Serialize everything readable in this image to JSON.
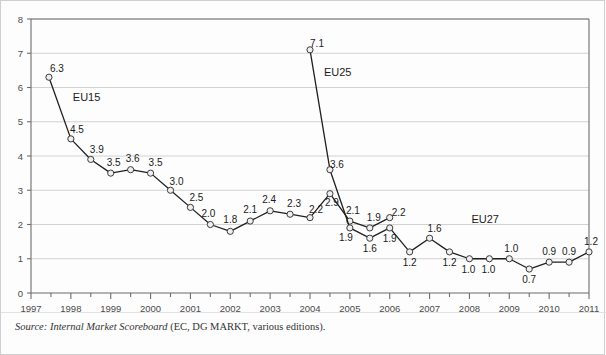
{
  "figure": {
    "background_color": "#fdfdfd",
    "border_color": "#cfcfcf"
  },
  "source": {
    "prefix": "Source:",
    "title": "Internal Market Scoreboard",
    "rest": "(EC, DG MARKT, various editions)."
  },
  "chart_data": {
    "type": "line",
    "title": "",
    "xlabel": "",
    "ylabel": "",
    "xlim": [
      1997,
      2011
    ],
    "ylim": [
      0,
      8
    ],
    "yticks": [
      0,
      1,
      2,
      3,
      4,
      5,
      6,
      7,
      8
    ],
    "xticks": [
      1997,
      1998,
      1999,
      2000,
      2001,
      2002,
      2003,
      2004,
      2005,
      2006,
      2007,
      2008,
      2009,
      2010,
      2011
    ],
    "xtick_labels": [
      "1997",
      "1998",
      "1999",
      "2000",
      "2001",
      "2002",
      "2003",
      "2004",
      "2005",
      "2006",
      "2007",
      "2008",
      "2009",
      "2010",
      "2011"
    ],
    "minor_xticks_per_year": 2,
    "grid": "horizontal",
    "legend_position": "inline-annotations",
    "marker": "open-circle",
    "line_color": "#1f1f1f",
    "marker_fill": "#efefef",
    "series": [
      {
        "name": "EU15",
        "label_x": 1998.05,
        "label_y": 5.62,
        "x": [
          1997.45,
          1998.0,
          1998.5,
          1999.0,
          1999.5,
          2000.0,
          2000.5,
          2001.0,
          2001.5,
          2002.0,
          2002.5,
          2003.0,
          2003.5,
          2004.0,
          2004.5,
          2005.0,
          2005.5,
          2006.0
        ],
        "values": [
          6.3,
          4.5,
          3.9,
          3.5,
          3.6,
          3.5,
          3.0,
          2.5,
          2.0,
          1.8,
          2.1,
          2.4,
          2.3,
          2.2,
          2.9,
          2.1,
          1.9,
          2.2
        ],
        "label_offsets": [
          {
            "dx": 8,
            "dy": -5
          },
          {
            "dx": 6,
            "dy": -6
          },
          {
            "dx": 6,
            "dy": -6
          },
          {
            "dx": 3,
            "dy": -7
          },
          {
            "dx": 2,
            "dy": -8
          },
          {
            "dx": 5,
            "dy": -7
          },
          {
            "dx": 6,
            "dy": -5
          },
          {
            "dx": 6,
            "dy": -6
          },
          {
            "dx": -2,
            "dy": -8
          },
          {
            "dx": 0,
            "dy": -8
          },
          {
            "dx": 0,
            "dy": -8
          },
          {
            "dx": -1,
            "dy": -8
          },
          {
            "dx": 4,
            "dy": -7
          },
          {
            "dx": 6,
            "dy": -5
          },
          {
            "dx": 2,
            "dy": 12
          },
          {
            "dx": 3,
            "dy": -7
          },
          {
            "dx": 4,
            "dy": -7
          },
          {
            "dx": 9,
            "dy": -2
          }
        ]
      },
      {
        "name": "EU25",
        "label_x": 2004.35,
        "label_y": 6.35,
        "x": [
          2004.0,
          2004.5,
          2005.0,
          2005.5,
          2006.0,
          2006.5,
          2007.0,
          2007.5,
          2008.0,
          2008.5,
          2009.0,
          2009.5,
          2010.0,
          2010.5,
          2011.0
        ],
        "values": [
          7.1,
          3.6,
          1.9,
          1.6,
          1.9,
          1.2,
          1.6,
          1.2,
          1.0,
          1.0,
          1.0,
          0.7,
          0.9,
          0.9,
          1.2
        ],
        "label_offsets": [
          {
            "dx": 7,
            "dy": -3
          },
          {
            "dx": 7,
            "dy": -2
          },
          {
            "dx": -4,
            "dy": 13
          },
          {
            "dx": 0,
            "dy": 14
          },
          {
            "dx": 0,
            "dy": 14
          },
          {
            "dx": 0,
            "dy": 14
          },
          {
            "dx": 5,
            "dy": -6
          },
          {
            "dx": 0,
            "dy": 14
          },
          {
            "dx": -1,
            "dy": 14
          },
          {
            "dx": -1,
            "dy": 14
          },
          {
            "dx": 2,
            "dy": -7
          },
          {
            "dx": 0,
            "dy": 14
          },
          {
            "dx": 0,
            "dy": -7
          },
          {
            "dx": 0,
            "dy": -7
          },
          {
            "dx": 2,
            "dy": -7
          }
        ]
      },
      {
        "name": "EU27",
        "label_x": 2008.05,
        "label_y": 2.05,
        "x": [],
        "values": [],
        "label_offsets": []
      }
    ]
  }
}
